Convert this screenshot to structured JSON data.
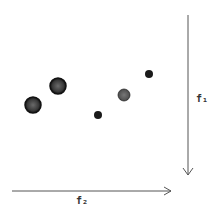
{
  "diagram": {
    "axes": {
      "vertical": {
        "label": "f₁",
        "direction": "down"
      },
      "horizontal": {
        "label": "f₂",
        "direction": "right"
      }
    },
    "points": [
      {
        "id": "p1",
        "cx": 33,
        "cy": 105,
        "r": 8,
        "color": "#4a4a4a"
      },
      {
        "id": "p2",
        "cx": 58,
        "cy": 86,
        "r": 8,
        "color": "#4a4a4a"
      },
      {
        "id": "p3",
        "cx": 98,
        "cy": 115,
        "r": 4,
        "color": "#1a1a1a"
      },
      {
        "id": "p4",
        "cx": 124,
        "cy": 95,
        "r": 6,
        "color": "#555555"
      },
      {
        "id": "p5",
        "cx": 149,
        "cy": 74,
        "r": 4,
        "color": "#1a1a1a"
      }
    ],
    "colors": {
      "axis": "#555555",
      "background": "#ffffff"
    }
  }
}
